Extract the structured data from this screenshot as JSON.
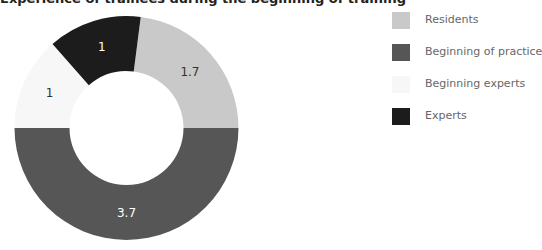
{
  "title": "Experience of trainees during the beginning of training",
  "chart_data": {
    "type": "pie",
    "subtype": "donut",
    "categories": [
      "Residents",
      "Beginning of practice",
      "Beginning experts",
      "Experts"
    ],
    "values": [
      1.7,
      3.7,
      1,
      1
    ],
    "value_labels": [
      "1.7",
      "3.7",
      "1",
      "1"
    ],
    "colors": [
      "#c9c9c9",
      "#565656",
      "#f7f7f7",
      "#1c1c1c"
    ],
    "label_colors": [
      "#333333",
      "#ffffff",
      "#333333",
      "#ffffff"
    ],
    "start_angle_deg": 7.3,
    "direction": "clockwise",
    "legend_position": "right"
  },
  "legend": {
    "items": [
      {
        "label": "Residents",
        "color": "#c9c9c9"
      },
      {
        "label": "Beginning of practice",
        "color": "#565656"
      },
      {
        "label": "Beginning experts",
        "color": "#f7f7f7"
      },
      {
        "label": "Experts",
        "color": "#1c1c1c"
      }
    ]
  }
}
